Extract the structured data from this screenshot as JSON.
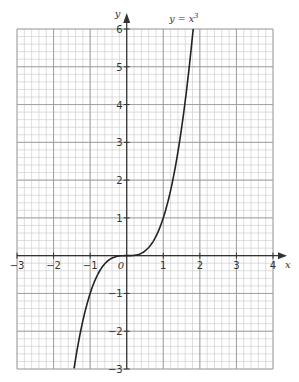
{
  "chart_data": {
    "type": "line",
    "title": "",
    "xlabel": "x",
    "ylabel": "y",
    "xlim": [
      -3,
      4
    ],
    "ylim": [
      -3,
      6
    ],
    "xticks": [
      -3,
      -2,
      -1,
      0,
      1,
      2,
      3,
      4
    ],
    "yticks": [
      -3,
      -2,
      -1,
      1,
      2,
      3,
      4,
      5,
      6
    ],
    "grid": true,
    "minor_grid_step": 0.2,
    "series": [
      {
        "name": "y = x³",
        "label": "y = x",
        "label_superscript": "3",
        "function": "x^3",
        "x": [
          -1.44,
          -1.3,
          -1.2,
          -1.0,
          -0.8,
          -0.6,
          -0.4,
          -0.2,
          0,
          0.2,
          0.4,
          0.6,
          0.8,
          1.0,
          1.2,
          1.4,
          1.6,
          1.82
        ],
        "values": [
          -3.0,
          -2.2,
          -1.73,
          -1.0,
          -0.51,
          -0.22,
          -0.06,
          -0.01,
          0,
          0.01,
          0.06,
          0.22,
          0.51,
          1.0,
          1.73,
          2.74,
          4.1,
          6.0
        ],
        "color": "#222222"
      }
    ]
  },
  "labels": {
    "x_axis": "x",
    "y_axis": "y",
    "origin": "0",
    "curve": "y = x",
    "curve_sup": "3",
    "x_ticks": [
      "−3",
      "−2",
      "−1",
      "1",
      "2",
      "3",
      "4"
    ],
    "y_ticks": [
      "6",
      "5",
      "4",
      "3",
      "2",
      "1",
      "−1",
      "−2",
      "−3"
    ]
  },
  "colors": {
    "minor_grid": "#c8c8c8",
    "major_grid": "#9a9a9a",
    "axis": "#333333",
    "curve": "#222222"
  }
}
